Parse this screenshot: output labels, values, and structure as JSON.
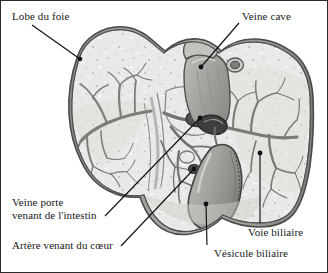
{
  "figure": {
    "language": "fr",
    "background_color": "#ffffff",
    "border_color": "#2b2b2b",
    "ink_color": "#17171a"
  },
  "labels": {
    "lobe": "Lobe du foie",
    "veine_cave": "Veine cave",
    "veine_porte_line1": "Veine porte",
    "veine_porte_line2": "venant de l'intestin",
    "artere": "Artère venant du cœur",
    "voie_biliaire": "Voie biliaire",
    "vesicule_biliaire": "Vésicule biliaire"
  },
  "palette": {
    "parenchyma_light": "#e9e9e7",
    "parenchyma_mid": "#d5d5d2",
    "capsule": "#9a9a97",
    "capsule_dark": "#6f6f6d",
    "vessel": "#8d8d8a",
    "vessel_dark": "#5d5d5b",
    "cava": "#b3b3b0",
    "gallbladder": "#a9a9a6",
    "outline": "#3a3a38"
  }
}
